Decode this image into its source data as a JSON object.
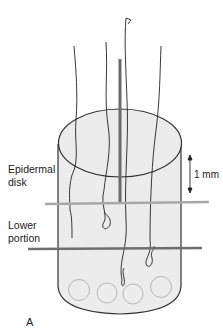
{
  "diagram": {
    "labels": {
      "epidermal_line1": "Epidermal",
      "epidermal_line2": "disk",
      "lower_line1": "Lower",
      "lower_line2": "portion",
      "scale": "1 mm",
      "panel": "A"
    },
    "colors": {
      "cylinder_fill": "#ececec",
      "outline": "#333333",
      "light_line": "#a8a8a8",
      "dark_line": "#6e6e6e",
      "rod": "#6a6a6a",
      "circles": "#b5b5b5"
    }
  }
}
